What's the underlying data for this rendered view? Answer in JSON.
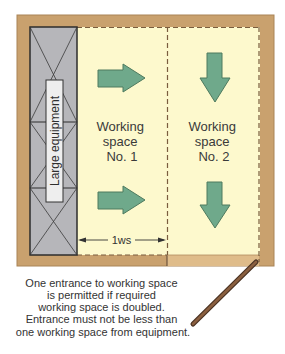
{
  "figure": {
    "equipment_label": "Large equipment",
    "working_space_1": {
      "line1": "Working",
      "line2": "space",
      "line3": "No. 1"
    },
    "working_space_2": {
      "line1": "Working",
      "line2": "space",
      "line3": "No. 2"
    },
    "measurement_label": "1ws",
    "caption": [
      "One entrance to working space",
      "is permitted if required",
      "working space is doubled.",
      "Entrance must not be less than",
      "one working space from equipment."
    ]
  },
  "colors": {
    "wall": "#c9a16e",
    "door_opening": "#dfbc8a",
    "working_space": "#fdf9cd",
    "equipment": "#b6b6ba",
    "arrow_fill": "#6fa98b",
    "arrow_stroke": "#4e7a5e",
    "door": "#7e5639"
  }
}
